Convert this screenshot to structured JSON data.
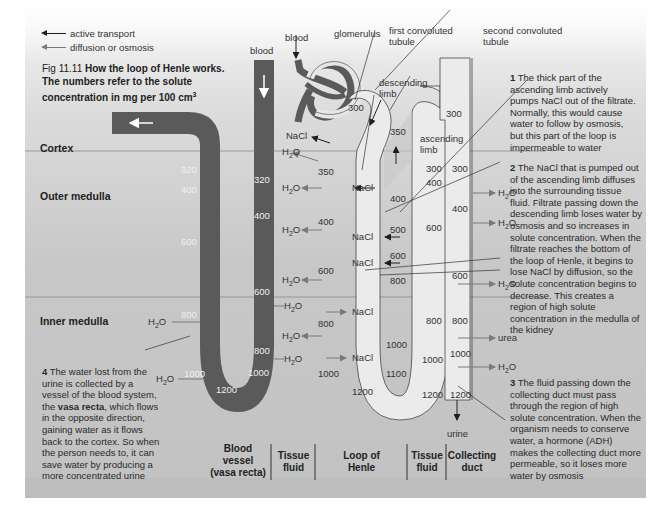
{
  "legend": {
    "active_transport": "active transport",
    "diffusion": "diffusion or osmosis"
  },
  "caption": {
    "fig": "Fig 11.11",
    "title": "How the loop of Henle works.",
    "line2": "The numbers refer to the solute",
    "line3": "concentration in mg per 100 cm",
    "sup": "3"
  },
  "zones": {
    "cortex": "Cortex",
    "outer_medulla": "Outer medulla",
    "inner_medulla": "Inner medulla"
  },
  "labels": {
    "blood_left": "blood",
    "blood_glom": "blood",
    "glomerulus": "glomerulus",
    "first_convoluted_1": "first convoluted",
    "first_convoluted_2": "tubule",
    "second_convoluted_1": "second convoluted",
    "second_convoluted_2": "tubule",
    "descending_1": "descending",
    "descending_2": "limb",
    "ascending_1": "ascending",
    "ascending_2": "limb",
    "urine": "urine"
  },
  "vasa_recta_values": {
    "v320": "320",
    "v400": "400",
    "v600": "600",
    "v800": "800",
    "v1000a": "1000",
    "v1200": "1200",
    "v1000b": "1000",
    "v800b": "800",
    "v600b": "600",
    "v400b": "400",
    "v320b": "320"
  },
  "loop_values": {
    "d300": "300",
    "d350": "350",
    "d400": "400",
    "d600": "600",
    "d800": "800",
    "d1000": "1000",
    "bottom1200": "1200",
    "a1100": "1100",
    "a1000": "1000",
    "a800": "800",
    "a600": "600",
    "a500": "500",
    "a400": "400",
    "a350": "350",
    "dct300": "300",
    "asc300": "300",
    "asc400": "400"
  },
  "tissue_values": {
    "t300": "300",
    "t400": "400",
    "t600": "600",
    "t800": "800",
    "t1000": "1000",
    "t1200": "1200"
  },
  "duct_values": {
    "c300": "300",
    "c400": "400",
    "c600": "600",
    "c800": "800",
    "c1000": "1000",
    "c1200": "1200"
  },
  "chem": {
    "nacl": "NaCl",
    "h2o_h": "H",
    "h2o_sub": "2",
    "h2o_o": "O",
    "urea": "urea"
  },
  "notes": {
    "n1_num": "1",
    "n1_text": "The thick part of the ascending limb actively pumps NaCl out of the filtrate. Normally, this would cause water to follow by osmosis, but this part of the loop is impermeable to water",
    "n2_num": "2",
    "n2_text": "The NaCl that is pumped out of the ascending limb diffuses into the surrounding tissue fluid. Filtrate passing down the descending limb loses water by osmosis and so increases in solute concentration. When the filtrate reaches the bottom of the loop of Henle, it begins to lose NaCl by diffusion, so the solute concentration begins to decrease. This creates a region of high solute concentration in the medulla of the kidney",
    "n3_num": "3",
    "n3_text": "The fluid passing down the collecting duct must pass through the region of high solute concentration. When the organism needs to conserve water, a hormone (ADH) makes the collecting duct more permeable, so it loses more water by osmosis",
    "n4_num": "4",
    "n4_pre": "The water lost from the urine is collected by a vessel of the blood system, the ",
    "n4_bold": "vasa recta",
    "n4_post": ", which flows in the opposite direction, gaining water as it flows back to the cortex. So when the person needs to, it can save water by producing a more concentrated urine"
  },
  "columns": {
    "blood_vessel_1": "Blood",
    "blood_vessel_2": "vessel",
    "blood_vessel_3": "(vasa recta)",
    "tissue_fluid_1a": "Tissue",
    "tissue_fluid_1b": "fluid",
    "loop_1": "Loop of",
    "loop_2": "Henle",
    "tissue_fluid_2a": "Tissue",
    "tissue_fluid_2b": "fluid",
    "collecting_1": "Collecting",
    "collecting_2": "duct"
  },
  "colors": {
    "vessel": "#5a5a5a",
    "tubule": "#ebebeb",
    "background": "#cfcfcf"
  }
}
